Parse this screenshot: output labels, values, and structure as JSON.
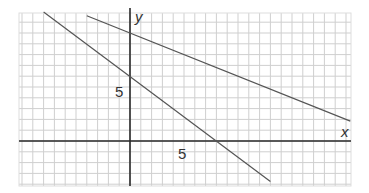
{
  "chart_data": {
    "type": "line",
    "title": "",
    "xlabel": "x",
    "ylabel": "y",
    "xlim": [
      -10.3,
      20.4
    ],
    "ylim": [
      -4.2,
      11.8
    ],
    "grid": true,
    "x_ticks_labeled": [
      5
    ],
    "y_ticks_labeled": [
      5
    ],
    "series": [
      {
        "name": "line-upper",
        "equation": "y = 10 - 0.4x",
        "points": [
          [
            -4,
            11.6
          ],
          [
            20.4,
            1.84
          ]
        ]
      },
      {
        "name": "line-lower",
        "equation": "y = 6 - 0.75x",
        "points": [
          [
            -8,
            12
          ],
          [
            13,
            -3.75
          ]
        ]
      }
    ],
    "intercepts": {
      "line-upper": {
        "y_intercept": 10
      },
      "line-lower": {
        "y_intercept": 6,
        "x_intercept": 8
      }
    }
  },
  "labels": {
    "x_axis": "x",
    "y_axis": "y",
    "x_tick": "5",
    "y_tick": "5"
  },
  "colors": {
    "grid": "#cfcfcf",
    "axis": "#2a2a2a",
    "line": "#555555"
  }
}
